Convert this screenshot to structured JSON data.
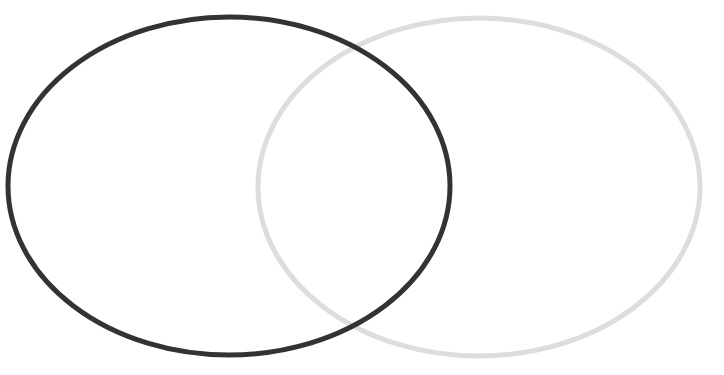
{
  "diagram": {
    "type": "venn",
    "caption_visible": false,
    "sets": [
      {
        "name": "left-set",
        "label": "",
        "stroke": "#333333",
        "cx": 229,
        "cy": 186,
        "rx": 221,
        "ry": 169,
        "stroke_width": 5
      },
      {
        "name": "right-set",
        "label": "",
        "stroke": "#dddddd",
        "cx": 479,
        "cy": 187,
        "rx": 221,
        "ry": 169,
        "stroke_width": 5
      }
    ],
    "background": "#ffffff"
  }
}
